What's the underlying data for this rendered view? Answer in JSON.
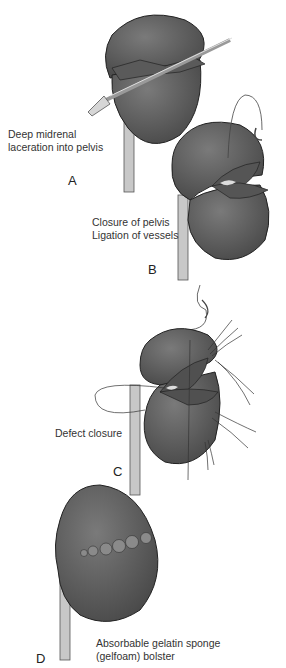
{
  "figure": {
    "colors": {
      "kidney": "#6b6b6b",
      "kidney_dark": "#3f3f3f",
      "ureter": "#bdbdbd",
      "background": "#ffffff",
      "text": "#333333"
    },
    "panels": [
      {
        "id": "A",
        "letter": "A",
        "caption_lines": [
          "Deep midrenal",
          "laceration into pelvis"
        ]
      },
      {
        "id": "B",
        "letter": "B",
        "caption_lines": [
          "Closure of pelvis",
          "Ligation of vessels"
        ]
      },
      {
        "id": "C",
        "letter": "C",
        "caption_lines": [
          "Defect closure"
        ]
      },
      {
        "id": "D",
        "letter": "D",
        "caption_lines": [
          "Absorbable gelatin sponge",
          "(gelfoam) bolster"
        ]
      }
    ]
  }
}
